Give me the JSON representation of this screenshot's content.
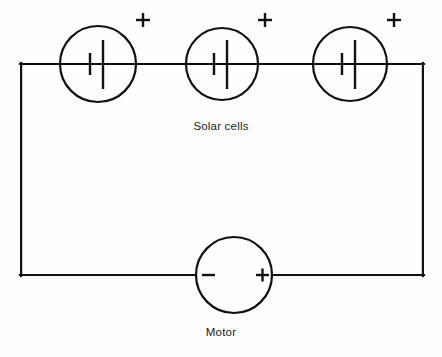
{
  "diagram": {
    "type": "circuit-schematic",
    "line_color": "#111111",
    "background_color": "#fefefe",
    "canvas": {
      "width": 442,
      "height": 357
    }
  },
  "labels": {
    "solar_cells": "Solar cells",
    "motor": "Motor"
  },
  "solar_cells": [
    {
      "name": "solar-cell-1",
      "center_x": 98,
      "center_y": 64,
      "radius": 38,
      "polarity_marker": "+",
      "marker_x": 143,
      "marker_y": 20
    },
    {
      "name": "solar-cell-2",
      "center_x": 222,
      "center_y": 64,
      "radius": 36,
      "polarity_marker": "+",
      "marker_x": 265,
      "marker_y": 20
    },
    {
      "name": "solar-cell-3",
      "center_x": 350,
      "center_y": 64,
      "radius": 37,
      "polarity_marker": "+",
      "marker_x": 394,
      "marker_y": 20
    }
  ],
  "motor": {
    "name": "motor",
    "center_x": 234,
    "center_y": 275,
    "radius": 38,
    "negative_terminal": "−",
    "positive_terminal": "+"
  },
  "wiring": {
    "top_y": 64,
    "bottom_y": 275,
    "left_x": 20,
    "right_x": 424
  }
}
